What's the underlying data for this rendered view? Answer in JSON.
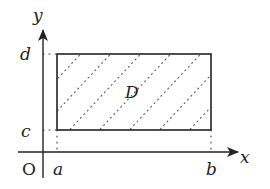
{
  "diagram": {
    "type": "region-on-coordinate-plane",
    "axes": {
      "x_label": "x",
      "y_label": "y",
      "origin_label": "O"
    },
    "ticks": {
      "x": [
        "a",
        "b"
      ],
      "y": [
        "c",
        "d"
      ]
    },
    "region": {
      "label": "D",
      "shape": "rectangle",
      "fill": "diagonal dotted hatching",
      "bounds": {
        "x_min": "a",
        "x_max": "b",
        "y_min": "c",
        "y_max": "d"
      }
    },
    "colors": {
      "stroke": "#222222",
      "background": "#ffffff"
    }
  }
}
